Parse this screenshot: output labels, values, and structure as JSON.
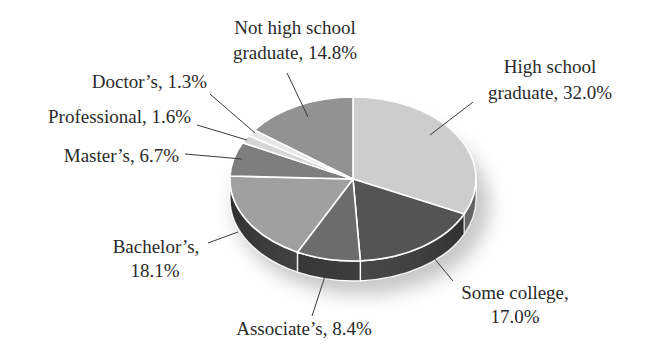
{
  "chart_data": {
    "type": "pie",
    "style": "3d-tilted",
    "title": "",
    "start_angle": "12 o'clock, clockwise",
    "categories": [
      "High school graduate",
      "Some college",
      "Associate's",
      "Bachelor's",
      "Master's",
      "Professional",
      "Doctor's",
      "Not high school graduate"
    ],
    "values": [
      32.0,
      17.0,
      8.4,
      18.1,
      6.7,
      1.6,
      1.3,
      14.8
    ],
    "unit": "%",
    "legend": "none (direct labels with leader lines)",
    "colors": [
      "#cdcdcd",
      "#545454",
      "#6c6c6c",
      "#a0a0a0",
      "#7e7e7e",
      "#d6d6d6",
      "#e6e6e6",
      "#929292"
    ],
    "side_colors": [
      "#7a7a7a",
      "#363636",
      "#2c2c2c",
      "#3a3a3a",
      "#444444",
      "#888888",
      "#999999",
      "#555555"
    ]
  },
  "labels": {
    "high_school": {
      "line1": "High school",
      "line2": "graduate, 32.0%"
    },
    "some_college": {
      "line1": "Some college,",
      "line2": "17.0%"
    },
    "associates": {
      "line1": "Associate’s, 8.4%"
    },
    "bachelors": {
      "line1": "Bachelor’s,",
      "line2": "18.1%"
    },
    "masters": {
      "line1": "Master’s, 6.7%"
    },
    "professional": {
      "line1": "Professional, 1.6%"
    },
    "doctors": {
      "line1": "Doctor’s, 1.3%"
    },
    "not_high_school": {
      "line1": "Not high school",
      "line2": "graduate, 14.8%"
    }
  }
}
